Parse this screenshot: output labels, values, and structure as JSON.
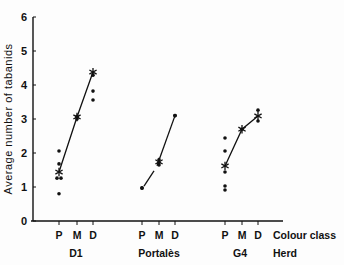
{
  "chart_data": {
    "type": "scatter",
    "title": "",
    "ylabel": "Average number of tabanids",
    "xlabel": "Colour class",
    "secondary_xlabel": "Herd",
    "ylim": [
      0,
      6
    ],
    "yticks": [
      0,
      1,
      2,
      3,
      4,
      5,
      6
    ],
    "grid": false,
    "legend": null,
    "colour_classes": [
      "P",
      "M",
      "D"
    ],
    "groups": [
      {
        "herd": "D1",
        "points": {
          "P": [
            2.06,
            1.68,
            1.26,
            1.26,
            0.8
          ],
          "M": [
            3.0,
            3.05,
            3.08
          ],
          "D": [
            4.29,
            3.82,
            3.56
          ]
        },
        "means": {
          "P": 1.44,
          "M": 3.06,
          "D": 4.38
        }
      },
      {
        "herd": "Portalès",
        "points": {
          "P": [
            0.97
          ],
          "M": [
            1.65,
            1.72,
            1.8
          ],
          "D": [
            3.1
          ]
        },
        "means": {
          "P": 0.97,
          "M": 1.74,
          "D": 3.1
        }
      },
      {
        "herd": "G4",
        "points": {
          "P": [
            2.44,
            2.06,
            1.44,
            1.03,
            0.91
          ],
          "M": [
            2.7
          ],
          "D": [
            3.26,
            2.94
          ]
        },
        "means": {
          "P": 1.62,
          "M": 2.7,
          "D": 3.09
        }
      }
    ]
  },
  "labels": {
    "ylabel": "Average number of tabanids",
    "colour_class": "Colour class",
    "herd": "Herd",
    "herd_names": [
      "D1",
      "Portalès",
      "G4"
    ],
    "class_letters": [
      "P",
      "M",
      "D"
    ],
    "ytick_labels": [
      "0",
      "1",
      "2",
      "3",
      "4",
      "5",
      "6"
    ]
  }
}
